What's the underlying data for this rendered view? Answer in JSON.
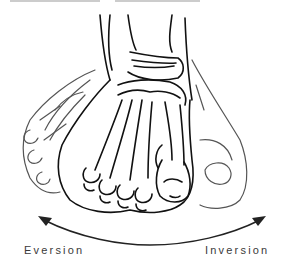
{
  "figure": {
    "labels": {
      "left": "Eversion",
      "right": "Inversion"
    },
    "arrow": {
      "direction": "bidirectional",
      "from": "Eversion",
      "to": "Inversion"
    },
    "colors": {
      "line_main": "#111111",
      "line_ghost": "#555555",
      "label": "#3a3a3a",
      "background": "#ffffff"
    }
  }
}
